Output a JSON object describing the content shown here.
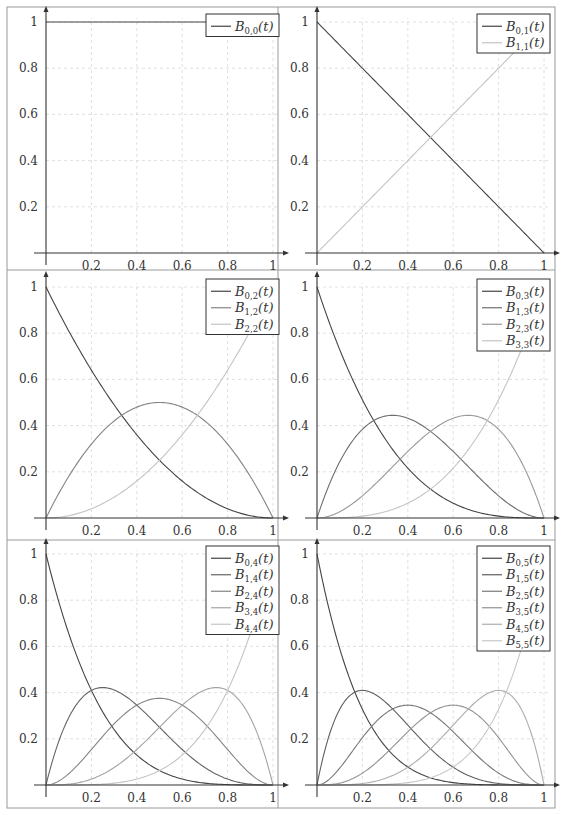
{
  "figure": {
    "layout": {
      "rows": 3,
      "cols": 2
    },
    "colors": {
      "frame": "#9a9a9a",
      "axis": "#333333",
      "grid": "#d8d8d8",
      "legend_border": "#333333",
      "text": "#333333"
    }
  },
  "chart_data": [
    {
      "type": "line",
      "degree": 0,
      "title": "",
      "xlabel": "",
      "ylabel": "",
      "xlim": [
        0,
        1
      ],
      "ylim": [
        0,
        1
      ],
      "xticks": [
        "0.2",
        "0.4",
        "0.6",
        "0.8",
        "1"
      ],
      "yticks": [
        "0.2",
        "0.4",
        "0.6",
        "0.8",
        "1"
      ],
      "grid": true,
      "legend_position": "north east",
      "series": [
        {
          "name": "B_{0,0}(t)",
          "sub": "0,0",
          "formula": "1",
          "color": "#444444"
        }
      ]
    },
    {
      "type": "line",
      "degree": 1,
      "title": "",
      "xlabel": "",
      "ylabel": "",
      "xlim": [
        0,
        1
      ],
      "ylim": [
        0,
        1
      ],
      "xticks": [
        "0.2",
        "0.4",
        "0.6",
        "0.8",
        "1"
      ],
      "yticks": [
        "0.2",
        "0.4",
        "0.6",
        "0.8",
        "1"
      ],
      "grid": true,
      "legend_position": "north east",
      "series": [
        {
          "name": "B_{0,1}(t)",
          "sub": "0,1",
          "formula": "1-t",
          "color": "#444444"
        },
        {
          "name": "B_{1,1}(t)",
          "sub": "1,1",
          "formula": "t",
          "color": "#c4c4c4"
        }
      ]
    },
    {
      "type": "line",
      "degree": 2,
      "title": "",
      "xlabel": "",
      "ylabel": "",
      "xlim": [
        0,
        1
      ],
      "ylim": [
        0,
        1
      ],
      "xticks": [
        "0.2",
        "0.4",
        "0.6",
        "0.8",
        "1"
      ],
      "yticks": [
        "0.2",
        "0.4",
        "0.6",
        "0.8",
        "1"
      ],
      "grid": true,
      "legend_position": "north east",
      "series": [
        {
          "name": "B_{0,2}(t)",
          "sub": "0,2",
          "formula": "(1-t)^2",
          "color": "#444444",
          "peak": [
            0,
            1
          ]
        },
        {
          "name": "B_{1,2}(t)",
          "sub": "1,2",
          "formula": "2t(1-t)",
          "color": "#848484",
          "peak": [
            0.5,
            0.5
          ]
        },
        {
          "name": "B_{2,2}(t)",
          "sub": "2,2",
          "formula": "t^2",
          "color": "#c4c4c4",
          "peak": [
            1,
            1
          ]
        }
      ]
    },
    {
      "type": "line",
      "degree": 3,
      "title": "",
      "xlabel": "",
      "ylabel": "",
      "xlim": [
        0,
        1
      ],
      "ylim": [
        0,
        1
      ],
      "xticks": [
        "0.2",
        "0.4",
        "0.6",
        "0.8",
        "1"
      ],
      "yticks": [
        "0.2",
        "0.4",
        "0.6",
        "0.8",
        "1"
      ],
      "grid": true,
      "legend_position": "north east",
      "series": [
        {
          "name": "B_{0,3}(t)",
          "sub": "0,3",
          "formula": "(1-t)^3",
          "color": "#444444",
          "peak": [
            0,
            1
          ]
        },
        {
          "name": "B_{1,3}(t)",
          "sub": "1,3",
          "formula": "3t(1-t)^2",
          "color": "#6e6e6e",
          "peak": [
            0.333,
            0.444
          ]
        },
        {
          "name": "B_{2,3}(t)",
          "sub": "2,3",
          "formula": "3t^2(1-t)",
          "color": "#999999",
          "peak": [
            0.667,
            0.444
          ]
        },
        {
          "name": "B_{3,3}(t)",
          "sub": "3,3",
          "formula": "t^3",
          "color": "#c4c4c4",
          "peak": [
            1,
            1
          ]
        }
      ]
    },
    {
      "type": "line",
      "degree": 4,
      "title": "",
      "xlabel": "",
      "ylabel": "",
      "xlim": [
        0,
        1
      ],
      "ylim": [
        0,
        1
      ],
      "xticks": [
        "0.2",
        "0.4",
        "0.6",
        "0.8",
        "1"
      ],
      "yticks": [
        "0.2",
        "0.4",
        "0.6",
        "0.8",
        "1"
      ],
      "grid": true,
      "legend_position": "north east",
      "series": [
        {
          "name": "B_{0,4}(t)",
          "sub": "0,4",
          "formula": "(1-t)^4",
          "color": "#444444",
          "peak": [
            0,
            1
          ]
        },
        {
          "name": "B_{1,4}(t)",
          "sub": "1,4",
          "formula": "4t(1-t)^3",
          "color": "#646464",
          "peak": [
            0.25,
            0.422
          ]
        },
        {
          "name": "B_{2,4}(t)",
          "sub": "2,4",
          "formula": "6t^2(1-t)^2",
          "color": "#848484",
          "peak": [
            0.5,
            0.375
          ]
        },
        {
          "name": "B_{3,4}(t)",
          "sub": "3,4",
          "formula": "4t^3(1-t)",
          "color": "#a4a4a4",
          "peak": [
            0.75,
            0.422
          ]
        },
        {
          "name": "B_{4,4}(t)",
          "sub": "4,4",
          "formula": "t^4",
          "color": "#c4c4c4",
          "peak": [
            1,
            1
          ]
        }
      ]
    },
    {
      "type": "line",
      "degree": 5,
      "title": "",
      "xlabel": "",
      "ylabel": "",
      "xlim": [
        0,
        1
      ],
      "ylim": [
        0,
        1
      ],
      "xticks": [
        "0.2",
        "0.4",
        "0.6",
        "0.8",
        "1"
      ],
      "yticks": [
        "0.2",
        "0.4",
        "0.6",
        "0.8",
        "1"
      ],
      "grid": true,
      "legend_position": "north east",
      "series": [
        {
          "name": "B_{0,5}(t)",
          "sub": "0,5",
          "formula": "(1-t)^5",
          "color": "#444444",
          "peak": [
            0,
            1
          ]
        },
        {
          "name": "B_{1,5}(t)",
          "sub": "1,5",
          "formula": "5t(1-t)^4",
          "color": "#5e5e5e",
          "peak": [
            0.2,
            0.41
          ]
        },
        {
          "name": "B_{2,5}(t)",
          "sub": "2,5",
          "formula": "10t^2(1-t)^3",
          "color": "#787878",
          "peak": [
            0.4,
            0.346
          ]
        },
        {
          "name": "B_{3,5}(t)",
          "sub": "3,5",
          "formula": "10t^3(1-t)^2",
          "color": "#929292",
          "peak": [
            0.6,
            0.346
          ]
        },
        {
          "name": "B_{4,5}(t)",
          "sub": "4,5",
          "formula": "5t^4(1-t)",
          "color": "#acacac",
          "peak": [
            0.8,
            0.41
          ]
        },
        {
          "name": "B_{5,5}(t)",
          "sub": "5,5",
          "formula": "t^5",
          "color": "#c8c8c8",
          "peak": [
            1,
            1
          ]
        }
      ]
    }
  ]
}
